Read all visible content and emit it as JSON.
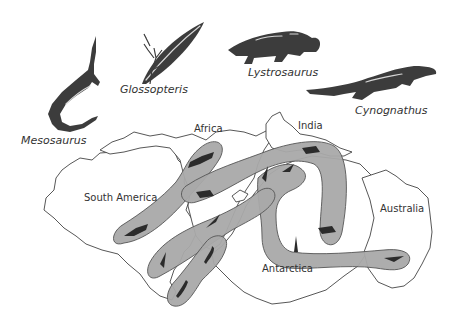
{
  "figure": {
    "species": [
      {
        "id": "mesosaurus",
        "label": "Mesosaurus"
      },
      {
        "id": "glossopteris",
        "label": "Glossopteris"
      },
      {
        "id": "lystrosaurus",
        "label": "Lystrosaurus"
      },
      {
        "id": "cynognathus",
        "label": "Cynognathus"
      }
    ],
    "continents": [
      {
        "id": "south-america",
        "label": "South America"
      },
      {
        "id": "africa",
        "label": "Africa"
      },
      {
        "id": "india",
        "label": "India"
      },
      {
        "id": "antarctica",
        "label": "Antarctica"
      },
      {
        "id": "australia",
        "label": "Australia"
      }
    ],
    "colors": {
      "band_fill": "#a9a9a9",
      "band_stroke": "#555555",
      "coastline": "#444444",
      "silhouette": "#3c3c3c",
      "background": "#ffffff"
    }
  }
}
